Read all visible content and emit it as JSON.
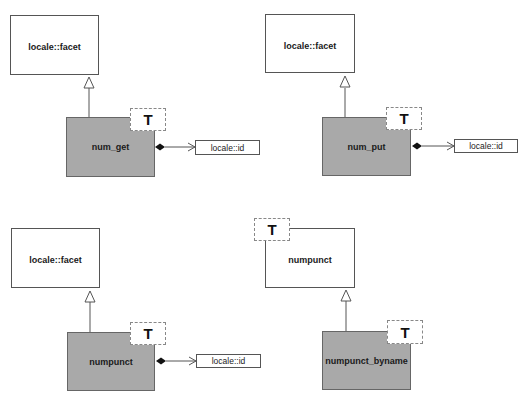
{
  "diagrams": [
    {
      "base": "locale::facet",
      "derived": "num_get",
      "derived_template_param": "T",
      "composition_target": "locale::id"
    },
    {
      "base": "locale::facet",
      "derived": "num_put",
      "derived_template_param": "T",
      "composition_target": "locale::id"
    },
    {
      "base": "locale::facet",
      "derived": "numpunct",
      "derived_template_param": "T",
      "composition_target": "locale::id"
    },
    {
      "base": "numpunct",
      "base_template_param": "T",
      "derived": "numpunct_byname",
      "derived_template_param": "T"
    }
  ],
  "colors": {
    "derived_fill": "#a9a9a9",
    "base_fill": "#ffffff",
    "border": "#555555",
    "template_border": "#888888"
  }
}
